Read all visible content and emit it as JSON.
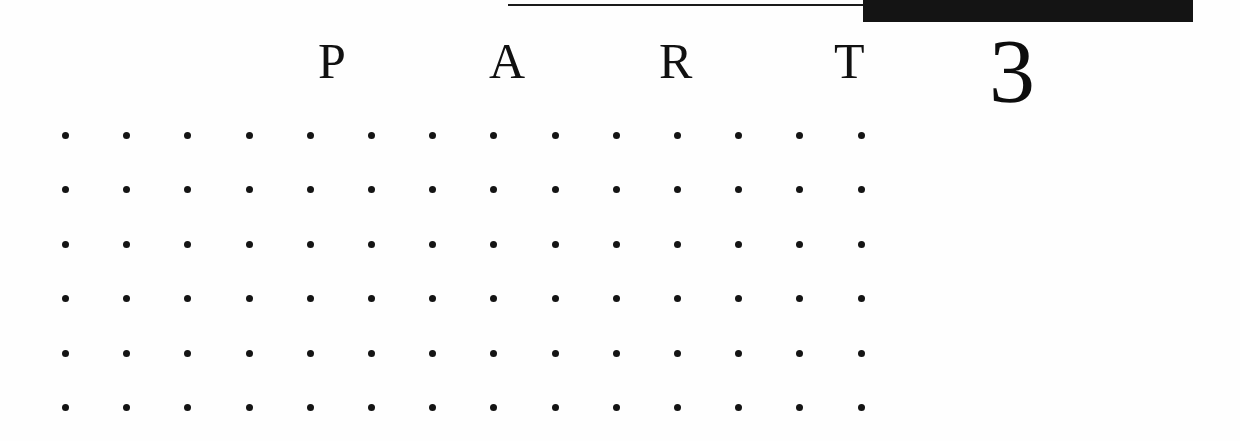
{
  "page": {
    "background_color": "#fefefe",
    "ink_color": "#111111",
    "width": 1240,
    "height": 441
  },
  "rules": {
    "thin_rule": {
      "name": "thin-horizontal-rule",
      "color": "#1a1a1a"
    },
    "thick_bar": {
      "name": "thick-black-bar",
      "color": "#141414"
    }
  },
  "heading": {
    "word": "PART",
    "letters": [
      "P",
      "A",
      "R",
      "T"
    ],
    "number": "3"
  },
  "dot_grid": {
    "columns": 14,
    "rows": 6,
    "column_spacing": 61.2,
    "row_spacing": 54.4,
    "dot_color": "#141414",
    "dot_diameter": 7
  }
}
